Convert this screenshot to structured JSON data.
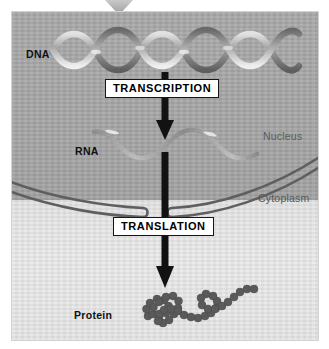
{
  "diagram": {
    "top_marker_icon": "triangle-down-icon",
    "colors": {
      "nucleus_fill": "#a8a8a8",
      "cytoplasm_fill": "#e7e7e7",
      "membrane_stroke": "#5f5f5f",
      "arrow_fill": "#121212",
      "dna_ribbon_dark": "#6e6e6e",
      "dna_ribbon_light": "#d6d6d6",
      "rna_strand": "#8e8e8e",
      "protein_bead": "#5c5c5c",
      "panel_border": "#d2d2d2",
      "label_text": "#101010",
      "compartment_text": "#5a5a5a"
    },
    "molecules": [
      {
        "id": "dna",
        "label": "DNA",
        "icon": "dna-double-helix-icon"
      },
      {
        "id": "rna",
        "label": "RNA",
        "icon": "rna-single-strand-icon"
      },
      {
        "id": "protein",
        "label": "Protein",
        "icon": "protein-bead-chain-icon"
      }
    ],
    "steps": [
      {
        "id": "transcription",
        "label": "TRANSCRIPTION",
        "arrow_icon": "arrow-down-icon"
      },
      {
        "id": "translation",
        "label": "TRANSLATION",
        "arrow_icon": "arrow-down-icon"
      }
    ],
    "compartments": [
      {
        "id": "nucleus",
        "label": "Nucleus"
      },
      {
        "id": "cytoplasm",
        "label": "Cytoplasm"
      }
    ]
  }
}
